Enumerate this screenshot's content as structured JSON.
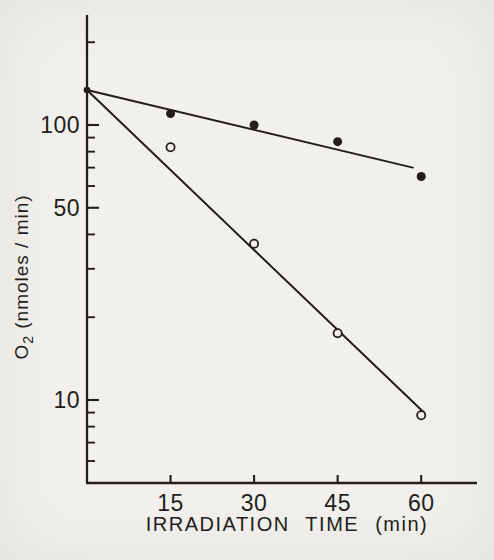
{
  "figure": {
    "background": "#f2f0ec",
    "ink": "#211e1b"
  },
  "chart_data": {
    "type": "scatter",
    "subtype": "semilog-decay with linear fit lines",
    "title": "",
    "xlabel": "IRRADIATION  TIME  (min)",
    "ylabel": "O2 (nmoles / min)",
    "ylabel_display": {
      "base": "O",
      "sub": "2",
      "rest": " (nmoles / min)"
    },
    "x_scale": "linear",
    "y_scale": "log",
    "xlim": [
      0,
      70
    ],
    "ylim": [
      5,
      250
    ],
    "grid": false,
    "legend": "none",
    "x_ticks": [
      15,
      30,
      45,
      60
    ],
    "y_major_ticks": [
      100,
      50,
      10
    ],
    "y_minor_ticks": [
      200,
      90,
      80,
      70,
      60,
      40,
      30,
      20,
      9,
      8,
      7,
      6
    ],
    "common_intercept": {
      "x": 0,
      "y": 134
    },
    "series": [
      {
        "name": "filled-circles",
        "marker": "filled-circle-marker",
        "points": [
          [
            15,
            110
          ],
          [
            30,
            100
          ],
          [
            45,
            87
          ],
          [
            60,
            65
          ]
        ],
        "fit_line": {
          "x1": 0,
          "y1": 134,
          "x2": 58.5,
          "y2": 70
        }
      },
      {
        "name": "open-circles",
        "marker": "open-circle-marker",
        "points": [
          [
            15,
            83
          ],
          [
            30,
            37
          ],
          [
            45,
            17.5
          ],
          [
            60,
            8.8
          ]
        ],
        "fit_line": {
          "x1": 0,
          "y1": 134,
          "x2": 60.5,
          "y2": 9
        }
      }
    ]
  }
}
